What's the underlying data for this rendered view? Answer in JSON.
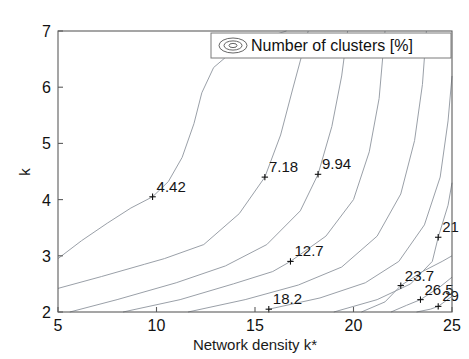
{
  "figure": {
    "title": "",
    "background": "#ffffff",
    "contour_color": "#9aa0a8",
    "axis_color": "#5c5c5c",
    "text_color": "#111111"
  },
  "legend": {
    "label": "Number of clusters  [%]",
    "icon": "contour-ellipse-icon",
    "position": "top-right"
  },
  "axes": {
    "xlabel": "Network density k*",
    "ylabel": "k",
    "xticks": [
      "5",
      "10",
      "15",
      "20",
      "25"
    ],
    "yticks": [
      "2",
      "3",
      "4",
      "5",
      "6",
      "7"
    ],
    "xlim": [
      5,
      25
    ],
    "ylim": [
      2,
      7
    ],
    "grid": false
  },
  "chart_data": {
    "type": "line",
    "subtype": "contour",
    "title": "",
    "xlabel": "Network density k*",
    "ylabel": "k",
    "xlim": [
      5,
      25
    ],
    "ylim": [
      2,
      7
    ],
    "grid": false,
    "legend": "Number of clusters  [%]",
    "legend_position": "top-right",
    "zlabel": "Number of clusters [%]",
    "contour_levels": [
      4.42,
      7.18,
      9.94,
      12.7,
      15.5,
      18.2,
      21,
      23.7,
      26.5,
      29
    ],
    "labeled_levels": [
      "4.42",
      "7.18",
      "9.94",
      "12.7",
      "18.2",
      "21",
      "23.7",
      "26.5",
      "29"
    ],
    "label_anchors": [
      {
        "level": "4.42",
        "x": 9.8,
        "y": 4.05
      },
      {
        "level": "7.18",
        "x": 15.5,
        "y": 4.4
      },
      {
        "level": "9.94",
        "x": 18.2,
        "y": 4.45
      },
      {
        "level": "12.7",
        "x": 16.8,
        "y": 2.9
      },
      {
        "level": "18.2",
        "x": 15.7,
        "y": 2.05
      },
      {
        "level": "21",
        "x": 24.3,
        "y": 3.33
      },
      {
        "level": "23.7",
        "x": 22.4,
        "y": 2.47
      },
      {
        "level": "26.5",
        "x": 23.4,
        "y": 2.22
      },
      {
        "level": "29",
        "x": 24.3,
        "y": 2.1
      }
    ],
    "contours": [
      {
        "level": 4.42,
        "points": [
          [
            5.0,
            2.95
          ],
          [
            6.2,
            3.27
          ],
          [
            7.5,
            3.58
          ],
          [
            8.7,
            3.85
          ],
          [
            9.8,
            4.05
          ],
          [
            10.6,
            4.32
          ],
          [
            11.3,
            4.75
          ],
          [
            11.9,
            5.35
          ],
          [
            12.3,
            5.9
          ],
          [
            12.9,
            6.35
          ],
          [
            13.8,
            6.62
          ],
          [
            15.2,
            6.85
          ],
          [
            16.6,
            7.0
          ]
        ]
      },
      {
        "level": 7.18,
        "points": [
          [
            5.0,
            2.42
          ],
          [
            7.2,
            2.63
          ],
          [
            9.4,
            2.85
          ],
          [
            10.4,
            2.95
          ],
          [
            12.4,
            3.2
          ],
          [
            14.2,
            3.75
          ],
          [
            15.5,
            4.4
          ],
          [
            16.3,
            5.15
          ],
          [
            16.9,
            5.95
          ],
          [
            17.4,
            6.6
          ],
          [
            17.7,
            7.0
          ]
        ]
      },
      {
        "level": 9.94,
        "points": [
          [
            5.6,
            2.0
          ],
          [
            8.0,
            2.22
          ],
          [
            11.0,
            2.52
          ],
          [
            13.5,
            2.82
          ],
          [
            15.6,
            3.2
          ],
          [
            17.3,
            3.8
          ],
          [
            18.2,
            4.45
          ],
          [
            18.9,
            5.3
          ],
          [
            19.4,
            6.2
          ],
          [
            19.7,
            7.0
          ]
        ]
      },
      {
        "level": 12.7,
        "points": [
          [
            8.3,
            2.0
          ],
          [
            11.2,
            2.22
          ],
          [
            13.9,
            2.5
          ],
          [
            15.9,
            2.72
          ],
          [
            16.8,
            2.9
          ],
          [
            18.6,
            3.35
          ],
          [
            20.0,
            4.0
          ],
          [
            20.8,
            4.85
          ],
          [
            21.3,
            5.8
          ],
          [
            21.6,
            7.0
          ]
        ]
      },
      {
        "level": 15.5,
        "points": [
          [
            11.6,
            2.0
          ],
          [
            14.5,
            2.22
          ],
          [
            17.2,
            2.48
          ],
          [
            19.4,
            2.8
          ],
          [
            21.2,
            3.35
          ],
          [
            22.4,
            4.1
          ],
          [
            23.1,
            5.05
          ],
          [
            23.5,
            6.05
          ],
          [
            23.7,
            7.0
          ]
        ]
      },
      {
        "level": 18.2,
        "points": [
          [
            15.7,
            2.05
          ],
          [
            18.3,
            2.25
          ],
          [
            20.6,
            2.52
          ],
          [
            22.3,
            2.9
          ],
          [
            23.6,
            3.55
          ],
          [
            24.4,
            4.4
          ],
          [
            24.8,
            5.4
          ],
          [
            25.0,
            6.2
          ]
        ]
      },
      {
        "level": 21,
        "points": [
          [
            19.0,
            2.0
          ],
          [
            21.2,
            2.22
          ],
          [
            22.9,
            2.5
          ],
          [
            24.0,
            2.9
          ],
          [
            24.3,
            3.33
          ],
          [
            24.8,
            3.9
          ],
          [
            25.0,
            4.3
          ]
        ]
      },
      {
        "level": 23.7,
        "points": [
          [
            20.4,
            2.0
          ],
          [
            21.6,
            2.18
          ],
          [
            22.4,
            2.47
          ],
          [
            23.5,
            2.72
          ],
          [
            24.5,
            2.9
          ],
          [
            25.0,
            3.0
          ]
        ]
      },
      {
        "level": 26.5,
        "points": [
          [
            21.9,
            2.0
          ],
          [
            22.7,
            2.12
          ],
          [
            23.4,
            2.22
          ],
          [
            24.4,
            2.45
          ],
          [
            25.0,
            2.62
          ]
        ]
      },
      {
        "level": 29,
        "points": [
          [
            23.2,
            2.0
          ],
          [
            23.9,
            2.05
          ],
          [
            24.3,
            2.1
          ],
          [
            25.0,
            2.28
          ]
        ]
      }
    ]
  }
}
